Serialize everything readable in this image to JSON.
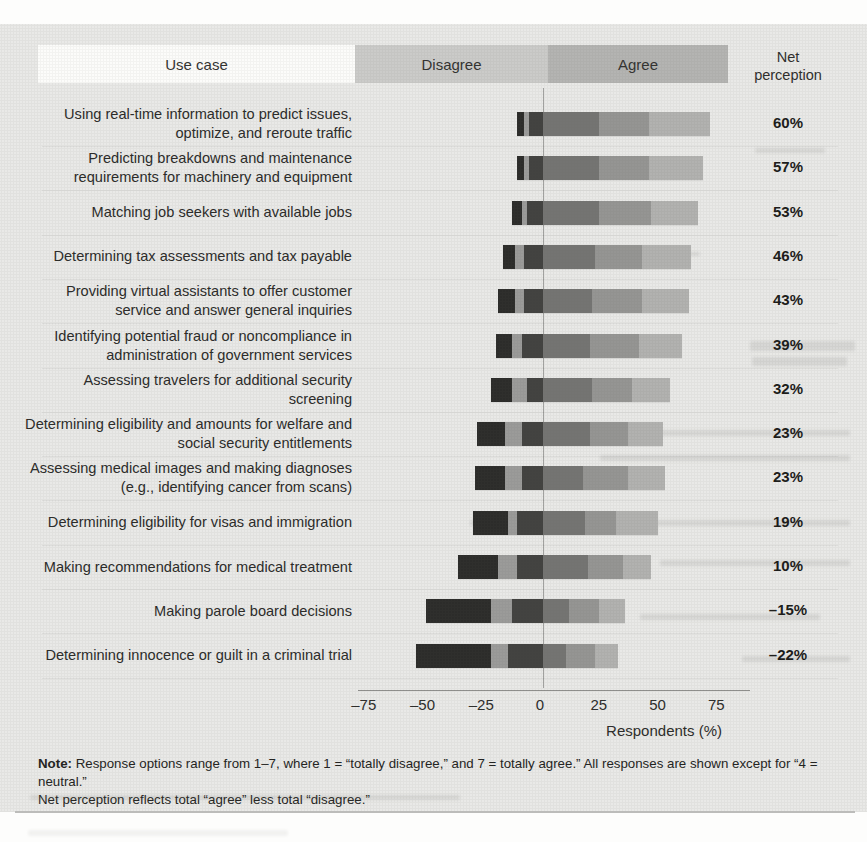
{
  "chart_data": {
    "type": "bar",
    "subtype": "diverging-stacked-horizontal",
    "title": "",
    "xlabel": "Respondents (%)",
    "xlim": [
      -87,
      87
    ],
    "grid": "faint horizontal row separators",
    "legend_position": "top header bands",
    "header": {
      "use_case": "Use case",
      "disagree": "Disagree",
      "agree": "Agree",
      "net": "Net perception"
    },
    "axis": {
      "ticks": [
        {
          "v": -75,
          "label": "–75"
        },
        {
          "v": -50,
          "label": "–50"
        },
        {
          "v": -25,
          "label": "–25"
        },
        {
          "v": 0,
          "label": "0"
        },
        {
          "v": 25,
          "label": "25"
        },
        {
          "v": 50,
          "label": "50"
        },
        {
          "v": 75,
          "label": "75"
        }
      ]
    },
    "segments": {
      "keys": [
        "disagree_1",
        "disagree_2",
        "disagree_3",
        "agree_5",
        "agree_6",
        "agree_7"
      ],
      "colors": {
        "disagree_1": "#2c2c2a",
        "disagree_2": "#9b9b99",
        "disagree_3": "#424240",
        "agree_5": "#747472",
        "agree_6": "#959593",
        "agree_7": "#b2b2b0"
      }
    },
    "rows": [
      {
        "label": "Using real-time information to predict issues, optimize, and reroute traffic",
        "disagree": [
          3,
          2,
          6
        ],
        "agree": [
          24,
          21,
          26
        ],
        "net": "60%"
      },
      {
        "label": "Predicting breakdowns and maintenance requirements for machinery and equipment",
        "disagree": [
          3,
          2,
          6
        ],
        "agree": [
          24,
          21,
          23
        ],
        "net": "57%"
      },
      {
        "label": "Matching job seekers with available jobs",
        "disagree": [
          4,
          2,
          7
        ],
        "agree": [
          24,
          22,
          20
        ],
        "net": "53%"
      },
      {
        "label": "Determining tax assessments and tax payable",
        "disagree": [
          5,
          4,
          8
        ],
        "agree": [
          22,
          20,
          21
        ],
        "net": "46%"
      },
      {
        "label": "Providing virtual assistants to offer customer service and answer general inquiries",
        "disagree": [
          7,
          4,
          8
        ],
        "agree": [
          21,
          21,
          20
        ],
        "net": "43%"
      },
      {
        "label": "Identifying potential fraud or noncompliance in administration of government services",
        "disagree": [
          7,
          4,
          9
        ],
        "agree": [
          20,
          21,
          18
        ],
        "net": "39%"
      },
      {
        "label": "Assessing travelers for additional security screening",
        "disagree": [
          9,
          6,
          7
        ],
        "agree": [
          21,
          17,
          16
        ],
        "net": "32%"
      },
      {
        "label": "Determining eligibility and amounts for welfare and social security entitlements",
        "disagree": [
          12,
          7,
          9
        ],
        "agree": [
          20,
          16,
          15
        ],
        "net": "23%"
      },
      {
        "label": "Assessing medical images and making diagnoses (e.g., identifying cancer from scans)",
        "disagree": [
          13,
          7,
          9
        ],
        "agree": [
          17,
          19,
          16
        ],
        "net": "23%"
      },
      {
        "label": "Determining eligibility for visas and immigration",
        "disagree": [
          15,
          4,
          11
        ],
        "agree": [
          18,
          13,
          18
        ],
        "net": "19%"
      },
      {
        "label": "Making recommendations for medical treatment",
        "disagree": [
          17,
          8,
          11
        ],
        "agree": [
          19,
          15,
          12
        ],
        "net": "10%"
      },
      {
        "label": "Making parole board decisions",
        "disagree": [
          28,
          9,
          13
        ],
        "agree": [
          11,
          13,
          11
        ],
        "net": "–15%"
      },
      {
        "label": "Determining innocence or guilt in a criminal trial",
        "disagree": [
          32,
          7,
          15
        ],
        "agree": [
          10,
          12,
          10
        ],
        "net": "–22%"
      }
    ]
  },
  "note": {
    "label": "Note:",
    "line1_rest": "Response options range from 1–7, where 1 = “totally disagree,” and 7 = totally agree.” All responses are shown except for “4 = neutral.”",
    "line2": "Net perception reflects total “agree” less total “disagree.”"
  },
  "colors": {
    "page_bg": "#e9e9e7",
    "use_case_band": "#fcfcfa",
    "disagree_band": "#cbcbc9",
    "agree_band": "#b4b4b2",
    "zero_line": "#a2a2a0",
    "axis_line": "#8f8f8d",
    "net_text": "#1b1b19",
    "label_text": "#2b2b29"
  }
}
